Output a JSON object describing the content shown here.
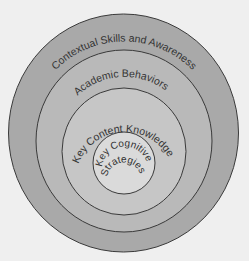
{
  "diagram": {
    "type": "concentric-circles",
    "rings": [
      {
        "label": "Contextual Skills and Awareness",
        "fill": "#a9a9a9"
      },
      {
        "label": "Academic Behaviors",
        "fill": "#b9b9b9"
      },
      {
        "label": "Key Content Knowledge",
        "fill": "#c6c6c6"
      },
      {
        "label_line1": "Key Cognitive",
        "label_line2": "Strategies",
        "fill": "#dadada"
      }
    ],
    "background": "#efefef",
    "stroke": "#3a3a3a"
  }
}
